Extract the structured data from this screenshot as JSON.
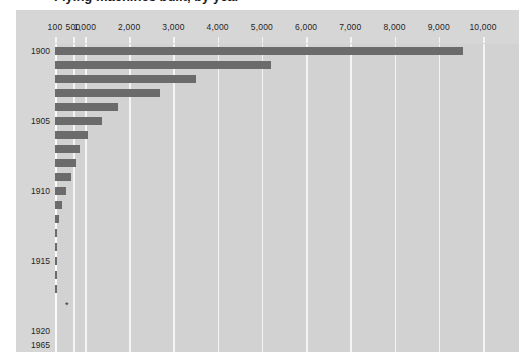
{
  "title": {
    "text": "Flying machines built, by year",
    "visible_fragment": true
  },
  "chart_data": {
    "type": "bar",
    "orientation": "horizontal",
    "title": "",
    "xlabel": "",
    "ylabel": "",
    "xlim": [
      0,
      10000
    ],
    "grid": true,
    "legend": null,
    "x_ticks": [
      {
        "label": "100",
        "value": 100
      },
      {
        "label": "500",
        "value": 500
      },
      {
        "label": "1,000",
        "value": 1000
      },
      {
        "label": "2,000",
        "value": 2000
      },
      {
        "label": "3,000",
        "value": 3000
      },
      {
        "label": "4,000",
        "value": 4000
      },
      {
        "label": "5,000",
        "value": 5000
      },
      {
        "label": "6,000",
        "value": 6000
      },
      {
        "label": "7,000",
        "value": 7000
      },
      {
        "label": "8,000",
        "value": 8000
      },
      {
        "label": "9,000",
        "value": 9000
      },
      {
        "label": "10,000",
        "value": 10000
      }
    ],
    "y_ticks": [
      "1900",
      "1905",
      "1910",
      "1915",
      "1920",
      "1965"
    ],
    "categories": [
      "1900",
      "1901",
      "1902",
      "1903",
      "1904",
      "1905",
      "1906",
      "1907",
      "1908",
      "1909",
      "1910",
      "1911",
      "1912",
      "1913",
      "1914",
      "1915",
      "1916",
      "1917",
      "1918",
      "1919",
      "1920",
      "1965"
    ],
    "values": [
      9550,
      5200,
      3500,
      2700,
      1750,
      1380,
      1060,
      780,
      620,
      450,
      350,
      250,
      190,
      150,
      120,
      95,
      70,
      55,
      0,
      0,
      0,
      0
    ],
    "annotations": [
      {
        "name": "footnote-asterisk",
        "symbol": "*",
        "category": "1918"
      }
    ],
    "colors": {
      "bar": "#6b6b6b",
      "plot_background": "#d2d2d2",
      "panel_background": "#d6d6d6",
      "gridline": "#f4f4f4",
      "page_background": "#ffffff",
      "text": "#1f1f1f"
    }
  }
}
